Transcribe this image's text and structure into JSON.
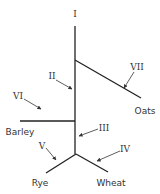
{
  "diagram": {
    "type": "phylogenetic-tree",
    "taxa": [
      {
        "id": "oats",
        "label": "Oats"
      },
      {
        "id": "barley",
        "label": "Barley"
      },
      {
        "id": "rye",
        "label": "Rye"
      },
      {
        "id": "wheat",
        "label": "Wheat"
      }
    ],
    "branches": [
      {
        "id": "I",
        "label": "I"
      },
      {
        "id": "II",
        "label": "II"
      },
      {
        "id": "III",
        "label": "III"
      },
      {
        "id": "IV",
        "label": "IV"
      },
      {
        "id": "V",
        "label": "V"
      },
      {
        "id": "VI",
        "label": "VI"
      },
      {
        "id": "VII",
        "label": "VII"
      }
    ],
    "colors": {
      "line": "#222222",
      "text": "#333333",
      "background": "#ffffff"
    }
  }
}
